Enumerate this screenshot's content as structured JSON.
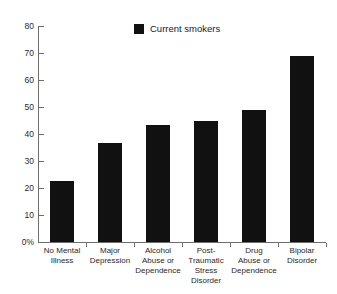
{
  "chart_data": {
    "type": "bar",
    "title": "",
    "subtitle": "",
    "xlabel": "",
    "ylabel": "",
    "ylim": [
      0,
      80
    ],
    "grid": false,
    "legend_position": "top-center",
    "categories": [
      "No Mental Illness",
      "Major Depression",
      "Alcohol Abuse or Dependence",
      "Post-Traumatic Stress Disorder",
      "Drug Abuse or Dependence",
      "Bipolar Disorder"
    ],
    "category_lines": [
      [
        "No Mental",
        "Illness"
      ],
      [
        "Major",
        "Depression"
      ],
      [
        "Alcohol",
        "Abuse or",
        "Dependence"
      ],
      [
        "Post-Traumatic",
        "Stress",
        "Disorder"
      ],
      [
        "Drug",
        "Abuse or",
        "Dependence"
      ],
      [
        "Bipolar",
        "Disorder"
      ]
    ],
    "series": [
      {
        "name": "Current smokers",
        "color": "#111111",
        "values": [
          22.5,
          36.5,
          43.5,
          45,
          49,
          69
        ]
      }
    ],
    "ytick_labels": [
      "80",
      "70",
      "60",
      "50",
      "40",
      "30",
      "20",
      "10",
      "0%"
    ],
    "ytick_values": [
      80,
      70,
      60,
      50,
      40,
      30,
      20,
      10,
      0
    ]
  },
  "legend": {
    "label": "Current smokers",
    "swatch_color": "#111111"
  }
}
